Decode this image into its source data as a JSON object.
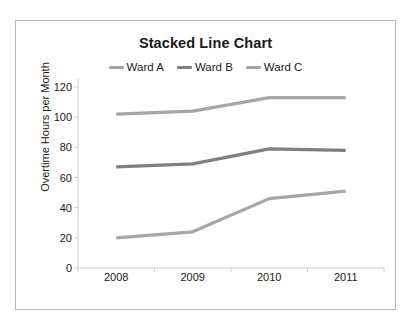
{
  "chart_data": {
    "type": "line",
    "title": "Stacked Line Chart",
    "xlabel": "",
    "ylabel": "Overtime Hours per Month",
    "categories": [
      "2008",
      "2009",
      "2010",
      "2011"
    ],
    "ylim": [
      0,
      120
    ],
    "yticks": [
      0,
      20,
      40,
      60,
      80,
      100,
      120
    ],
    "grid": false,
    "legend_position": "top-center",
    "series": [
      {
        "name": "Ward A",
        "values": [
          20,
          24,
          46,
          51
        ],
        "color": "#a6a6a6"
      },
      {
        "name": "Ward B",
        "values": [
          67,
          69,
          79,
          78
        ],
        "color": "#808080"
      },
      {
        "name": "Ward C",
        "values": [
          102,
          104,
          113,
          113
        ],
        "color": "#a6a6a6"
      }
    ]
  },
  "colors": {
    "frame_border": "#b8b8b8",
    "axis_line": "#d0d0d0",
    "text": "#1a1a1a",
    "background": "#ffffff"
  }
}
